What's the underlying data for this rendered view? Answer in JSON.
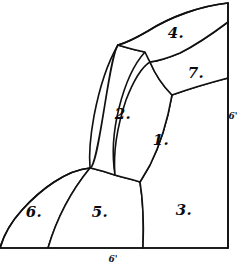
{
  "figure": {
    "background_color": "#ffffff",
    "line_color": "#111111",
    "width": 243,
    "height": 267
  },
  "regions": [
    {
      "id": "region-1",
      "label": "1.",
      "x": 161,
      "y": 140
    },
    {
      "id": "region-2",
      "label": "2.",
      "x": 123,
      "y": 114
    },
    {
      "id": "region-3",
      "label": "3.",
      "x": 184,
      "y": 210
    },
    {
      "id": "region-4",
      "label": "4.",
      "x": 176,
      "y": 33
    },
    {
      "id": "region-5",
      "label": "5.",
      "x": 100,
      "y": 212
    },
    {
      "id": "region-6",
      "label": "6.",
      "x": 34,
      "y": 212
    },
    {
      "id": "region-7",
      "label": "7.",
      "x": 196,
      "y": 73
    }
  ],
  "dimensions": [
    {
      "id": "right-edge-dimension",
      "label": "6'",
      "x": 233,
      "y": 116
    },
    {
      "id": "bottom-edge-dimension",
      "label": "6'",
      "x": 113,
      "y": 259
    }
  ]
}
